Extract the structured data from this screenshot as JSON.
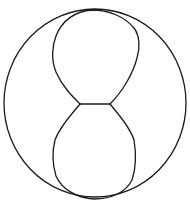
{
  "diagram": {
    "colors": {
      "background": "#ffffff",
      "stroke": "#1a1a1a"
    },
    "shapes": {
      "outer_circle": {
        "cx": 95,
        "cy": 103,
        "rx": 91,
        "ry": 94
      },
      "top_lobe": "upper rounded lobe touching top of circle",
      "bottom_lobe": "lower rounded lobe touching bottom of circle",
      "connector": "short horizontal segment at waist between lobes"
    }
  }
}
